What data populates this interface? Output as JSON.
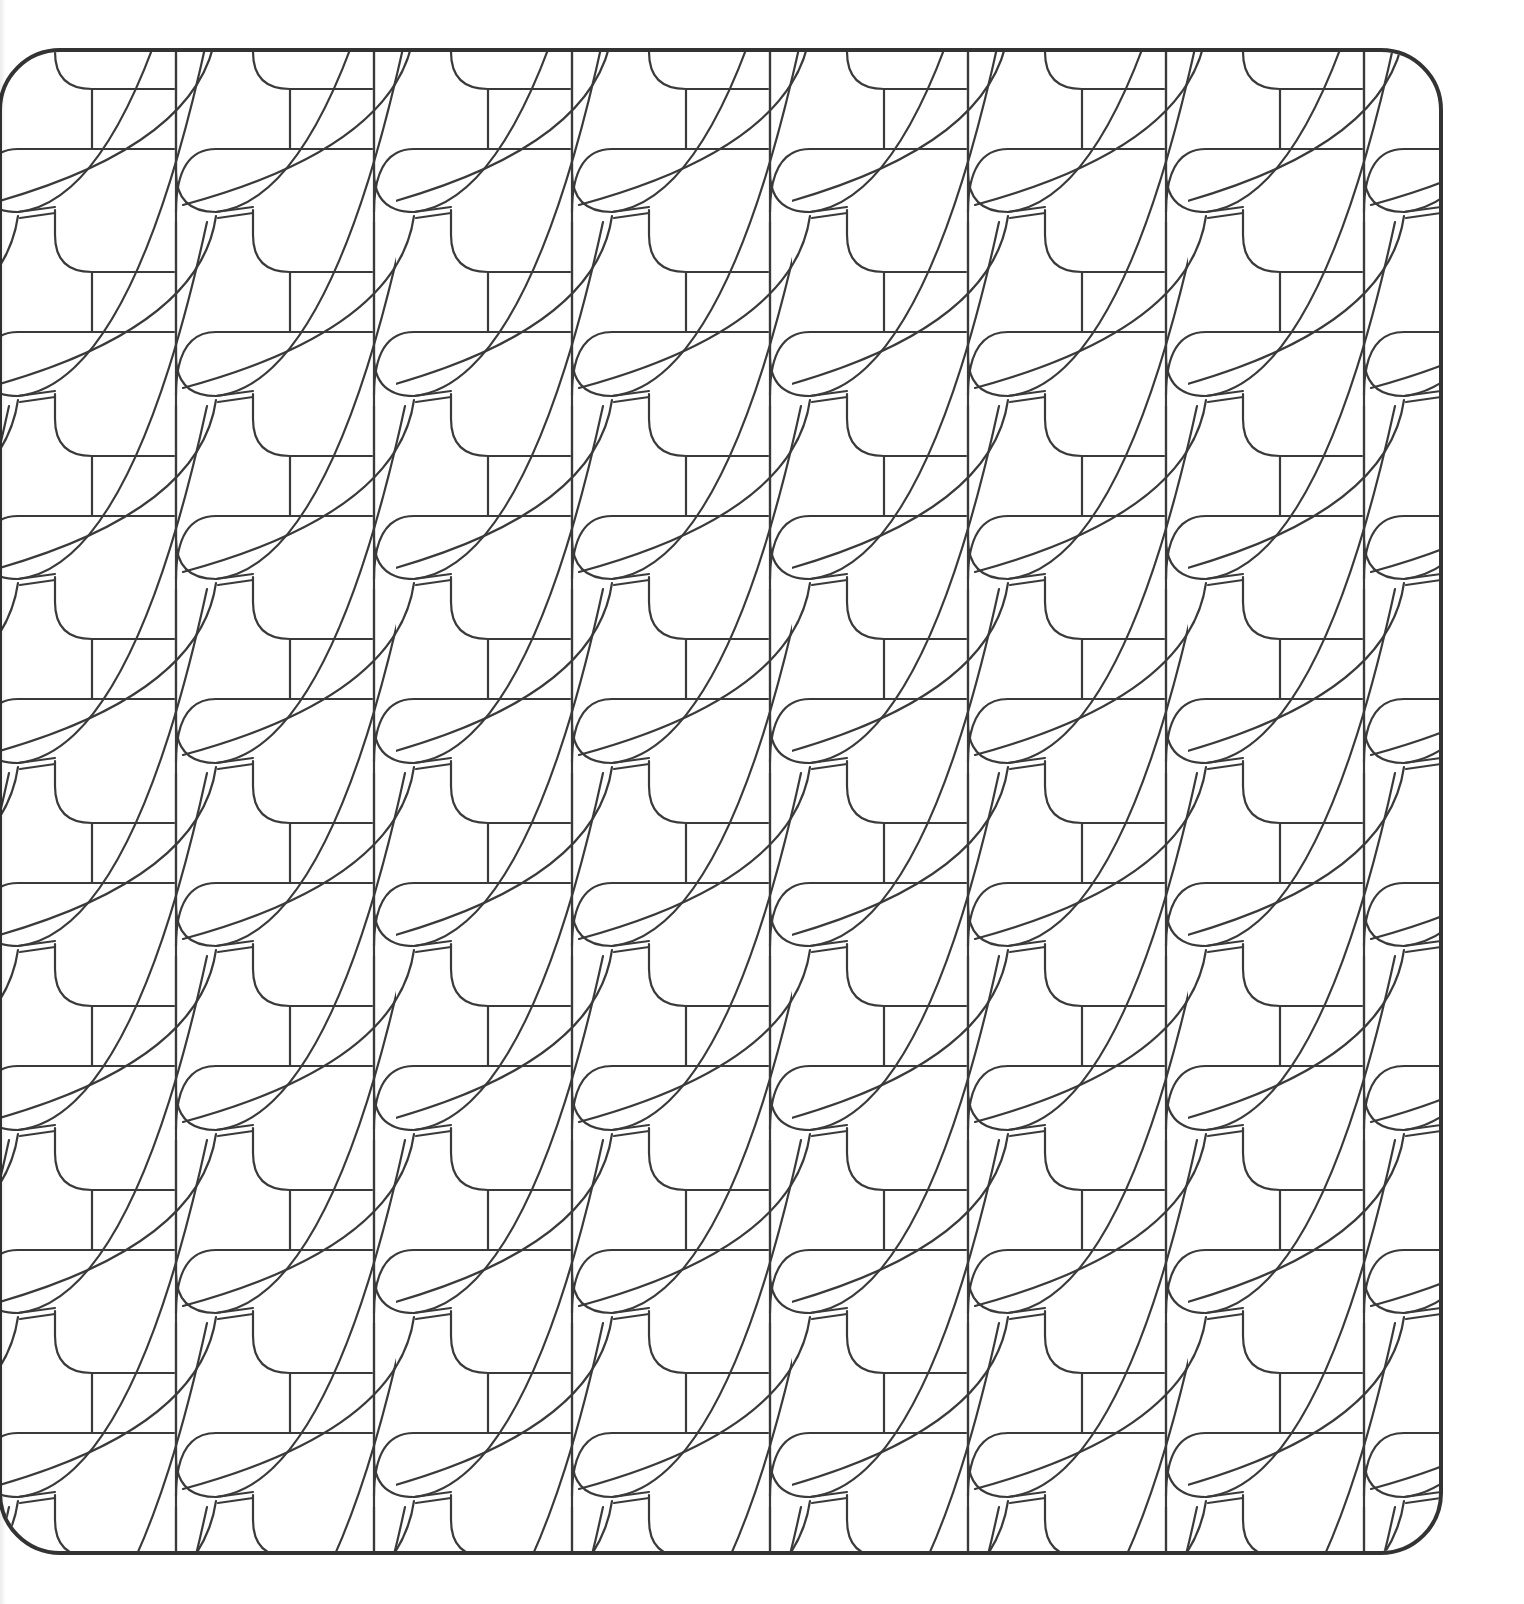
{
  "page": {
    "type": "coloring-page",
    "background": "#ffffff",
    "line_color": "#3a3a3a",
    "frame": {
      "x": 0,
      "y": 50,
      "width": 1441,
      "height": 1503,
      "corner_radius": 60,
      "stroke_width": 4
    },
    "tile": {
      "width": 396,
      "height": 367,
      "column_width": 198,
      "column_offset_y": 184
    }
  }
}
